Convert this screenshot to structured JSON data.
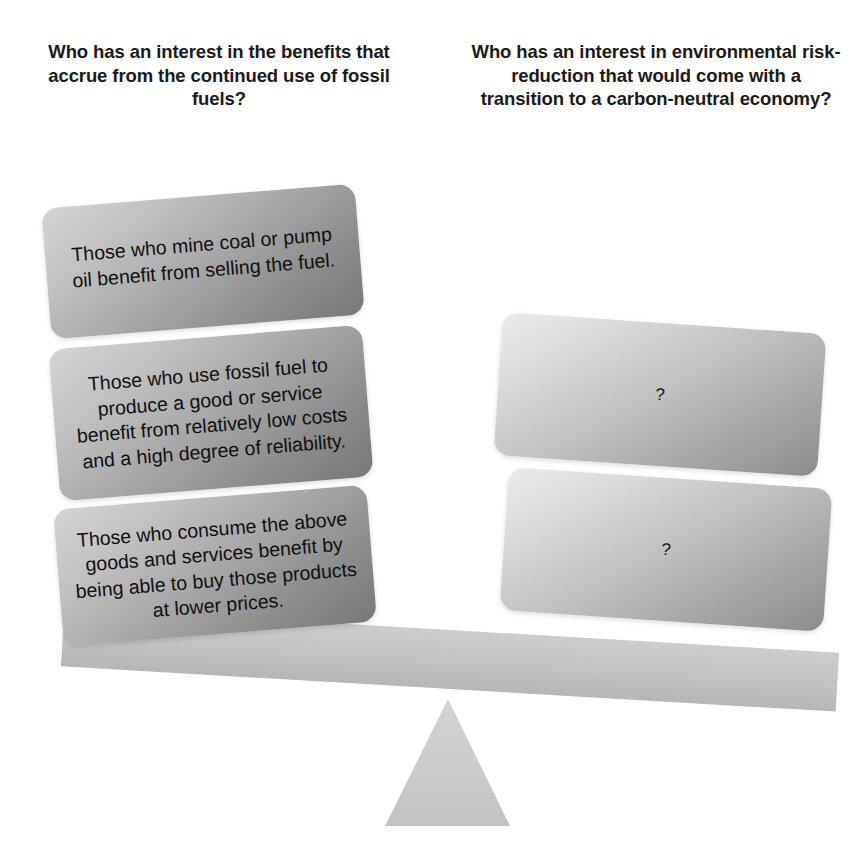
{
  "diagram": {
    "type": "seesaw-balance",
    "tilt": "left-side-down",
    "colors": {
      "background": "#ffffff",
      "heading_text": "#1a1a1a",
      "box_text": "#101010",
      "beam_light": "#cdcdcd",
      "beam_dark": "#b6b6b6",
      "fulcrum": "#cdcdcd",
      "left_box_light": "#d4d4d4",
      "left_box_dark": "#787878",
      "right_box_light": "#ebebeb",
      "right_box_dark": "#8c8c8c"
    }
  },
  "headings": {
    "left": "Who has an interest in the benefits that accrue from the continued use of fossil fuels?",
    "right": "Who has an interest in environmental risk-reduction that would come with a transition to a carbon-neutral economy?"
  },
  "left_side": {
    "boxes": [
      {
        "text": "Those who mine coal or pump oil benefit from selling the fuel."
      },
      {
        "text": "Those who use fossil fuel to produce a good or service benefit from relatively low costs and a high degree of reliability."
      },
      {
        "text": "Those who consume the above goods and services benefit by being able to buy those products at lower prices."
      }
    ]
  },
  "right_side": {
    "boxes": [
      {
        "text": "?"
      },
      {
        "text": "?"
      }
    ]
  },
  "seesaw": {
    "beam_label": "balance-beam",
    "fulcrum_label": "fulcrum-triangle"
  }
}
